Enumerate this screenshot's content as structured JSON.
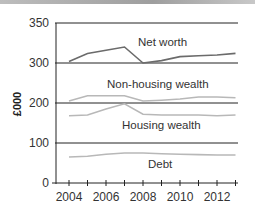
{
  "chart_data": {
    "type": "line",
    "title": "",
    "xlabel": "",
    "ylabel": "£000",
    "y_ticks": [
      0,
      100,
      200,
      300,
      350
    ],
    "x_ticks": [
      2004,
      2006,
      2008,
      2010,
      2012
    ],
    "x": [
      2004,
      2005,
      2006,
      2007,
      2008,
      2009,
      2010,
      2011,
      2012,
      2013
    ],
    "grid": "horizontal at 100, 300, 350",
    "series": [
      {
        "name": "Net worth",
        "color": "#6b6b6b",
        "values": [
          302,
          312,
          316,
          320,
          300,
          303,
          308,
          309,
          310,
          312
        ]
      },
      {
        "name": "Non-housing wealth",
        "color": "#b8b8b8",
        "values": [
          205,
          218,
          218,
          218,
          205,
          207,
          210,
          215,
          215,
          213
        ]
      },
      {
        "name": "Housing wealth",
        "color": "#b8b8b8",
        "values": [
          168,
          170,
          185,
          198,
          172,
          170,
          170,
          170,
          168,
          170
        ]
      },
      {
        "name": "Debt",
        "color": "#b8b8b8",
        "values": [
          65,
          67,
          72,
          75,
          75,
          73,
          72,
          71,
          70,
          70
        ]
      }
    ],
    "ylim": [
      0,
      350
    ]
  },
  "labels": {
    "net_worth": "Net worth",
    "non_housing": "Non-housing wealth",
    "housing": "Housing wealth",
    "debt": "Debt",
    "ylabel": "£000",
    "y0": "0",
    "y100": "100",
    "y200": "200",
    "y300": "300",
    "y350": "350",
    "x2004": "2004",
    "x2006": "2006",
    "x2008": "2008",
    "x2010": "2010",
    "x2012": "2012"
  }
}
